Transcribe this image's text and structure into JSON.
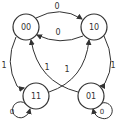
{
  "diagram": {
    "type": "state-machine",
    "colors": {
      "stroke": "#333333",
      "background": "#ffffff"
    },
    "nodes": [
      {
        "id": "00",
        "label": "00",
        "cx": 26,
        "cy": 27,
        "r": 13
      },
      {
        "id": "10",
        "label": "10",
        "cx": 94,
        "cy": 27,
        "r": 13
      },
      {
        "id": "11",
        "label": "11",
        "cx": 36,
        "cy": 96,
        "r": 13
      },
      {
        "id": "01",
        "label": "01",
        "cx": 91,
        "cy": 96,
        "r": 13
      }
    ],
    "edges": [
      {
        "from": "00",
        "to": "10",
        "label": "0"
      },
      {
        "from": "10",
        "to": "00",
        "label": "0"
      },
      {
        "from": "00",
        "to": "11",
        "label": "1"
      },
      {
        "from": "10",
        "to": "01",
        "label": "1"
      },
      {
        "from": "11",
        "to": "10",
        "label": "1"
      },
      {
        "from": "01",
        "to": "00",
        "label": "1"
      },
      {
        "from": "11",
        "to": "11",
        "label": "0"
      },
      {
        "from": "01",
        "to": "01",
        "label": "0"
      }
    ]
  }
}
